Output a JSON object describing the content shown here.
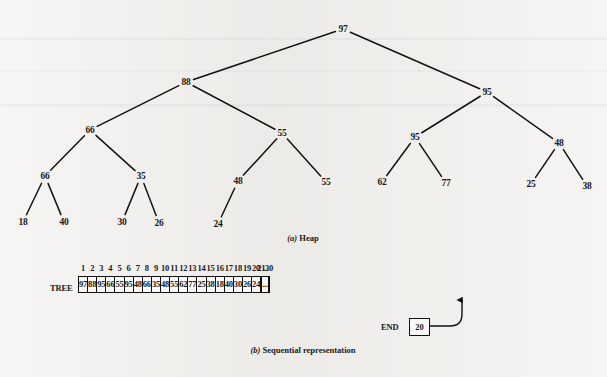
{
  "figure": {
    "heap_caption_marker": "(a)",
    "heap_caption_text": " Heap",
    "array_caption_marker": "(b)",
    "array_caption_text": " Sequential representation"
  },
  "heap": {
    "nodes": [
      {
        "id": "n1",
        "label": "97",
        "x": 343,
        "y": 29
      },
      {
        "id": "n2",
        "label": "88",
        "x": 186,
        "y": 82
      },
      {
        "id": "n3",
        "label": "95",
        "x": 487,
        "y": 92
      },
      {
        "id": "n4",
        "label": "66",
        "x": 90,
        "y": 130
      },
      {
        "id": "n5",
        "label": "55",
        "x": 282,
        "y": 133
      },
      {
        "id": "n6",
        "label": "95",
        "x": 415,
        "y": 137
      },
      {
        "id": "n7",
        "label": "48",
        "x": 559,
        "y": 143
      },
      {
        "id": "n8",
        "label": "66",
        "x": 45,
        "y": 176
      },
      {
        "id": "n9",
        "label": "35",
        "x": 141,
        "y": 176
      },
      {
        "id": "n10",
        "label": "48",
        "x": 238,
        "y": 181
      },
      {
        "id": "n11",
        "label": "55",
        "x": 326,
        "y": 182
      },
      {
        "id": "n12",
        "label": "62",
        "x": 382,
        "y": 182
      },
      {
        "id": "n13",
        "label": "77",
        "x": 446,
        "y": 183
      },
      {
        "id": "n14",
        "label": "25",
        "x": 531,
        "y": 184
      },
      {
        "id": "n15",
        "label": "38",
        "x": 587,
        "y": 186
      },
      {
        "id": "n16",
        "label": "18",
        "x": 23,
        "y": 222
      },
      {
        "id": "n17",
        "label": "40",
        "x": 64,
        "y": 222
      },
      {
        "id": "n18",
        "label": "30",
        "x": 122,
        "y": 222
      },
      {
        "id": "n19",
        "label": "26",
        "x": 159,
        "y": 223
      },
      {
        "id": "n20",
        "label": "24",
        "x": 218,
        "y": 224
      }
    ],
    "edges": [
      [
        "n1",
        "n2"
      ],
      [
        "n1",
        "n3"
      ],
      [
        "n2",
        "n4"
      ],
      [
        "n2",
        "n5"
      ],
      [
        "n3",
        "n6"
      ],
      [
        "n3",
        "n7"
      ],
      [
        "n4",
        "n8"
      ],
      [
        "n4",
        "n9"
      ],
      [
        "n5",
        "n10"
      ],
      [
        "n5",
        "n11"
      ],
      [
        "n6",
        "n12"
      ],
      [
        "n6",
        "n13"
      ],
      [
        "n7",
        "n14"
      ],
      [
        "n7",
        "n15"
      ],
      [
        "n8",
        "n16"
      ],
      [
        "n8",
        "n17"
      ],
      [
        "n9",
        "n18"
      ],
      [
        "n9",
        "n19"
      ],
      [
        "n10",
        "n20"
      ]
    ]
  },
  "array": {
    "name_label": "TREE",
    "column_headers": [
      "1",
      "2",
      "3",
      "4",
      "5",
      "6",
      "7",
      "8",
      "9",
      "10",
      "11",
      "12",
      "13",
      "14",
      "15",
      "16",
      "17",
      "18",
      "19",
      "20",
      "21",
      "...",
      "30"
    ],
    "cells": [
      "97",
      "88",
      "95",
      "66",
      "55",
      "95",
      "48",
      "66",
      "35",
      "48",
      "55",
      "62",
      "77",
      "25",
      "38",
      "18",
      "40",
      "30",
      "26",
      "24",
      "",
      "...",
      ""
    ],
    "pointer": {
      "label": "END",
      "value": "20",
      "target_index": 20
    }
  }
}
